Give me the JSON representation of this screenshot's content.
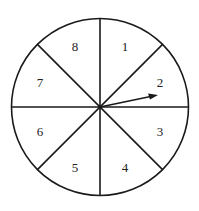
{
  "diagram": {
    "type": "spinner",
    "sector_count": 8,
    "sectors": [
      {
        "label": "1"
      },
      {
        "label": "2"
      },
      {
        "label": "3"
      },
      {
        "label": "4"
      },
      {
        "label": "5"
      },
      {
        "label": "6"
      },
      {
        "label": "7"
      },
      {
        "label": "8"
      }
    ],
    "pointer": {
      "points_to_sector": "2"
    },
    "colors": {
      "stroke": "#1a1a1a",
      "fill": "#ffffff"
    }
  }
}
